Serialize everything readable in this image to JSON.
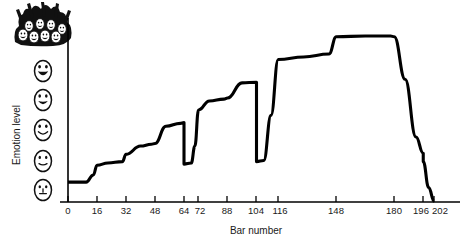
{
  "chart_data": {
    "type": "line",
    "title": "",
    "xlabel": "Bar number",
    "ylabel": "Emotion level",
    "xlim": [
      0,
      206
    ],
    "ylim": [
      0,
      5.6
    ],
    "grid": false,
    "legend": null,
    "x_ticks": [
      0,
      16,
      32,
      48,
      64,
      72,
      88,
      104,
      116,
      148,
      180,
      196,
      202
    ],
    "x_tick_labels": [
      "0",
      "16",
      "32",
      "48",
      "64",
      "72",
      "88",
      "104",
      "116",
      "148",
      "180",
      "196",
      "202"
    ],
    "y_ticks": [],
    "y_tick_labels": [],
    "y_axis_icons": [
      "neutral-face-icon",
      "slight-smile-face-icon",
      "smile-face-icon",
      "happy-face-icon",
      "very-happy-face-icon",
      "cheering-crowd-icon"
    ],
    "series": [
      {
        "name": "Emotion level",
        "comment": "Stepwise emotional intensity across bar numbers of a musical piece",
        "x": [
          0,
          10,
          14,
          16,
          22,
          30,
          32,
          40,
          46,
          48,
          54,
          62,
          64,
          64,
          68,
          70,
          72,
          78,
          86,
          88,
          96,
          104,
          104,
          108,
          112,
          116,
          130,
          144,
          148,
          164,
          178,
          180,
          186,
          192,
          196,
          196,
          199,
          202
        ],
        "y": [
          0.55,
          0.55,
          0.75,
          1.02,
          1.08,
          1.12,
          1.32,
          1.55,
          1.6,
          1.62,
          2.1,
          2.18,
          2.2,
          1.05,
          1.08,
          1.55,
          2.55,
          2.8,
          2.85,
          2.88,
          3.3,
          3.32,
          1.12,
          1.15,
          2.4,
          3.95,
          4.02,
          4.1,
          4.58,
          4.6,
          4.6,
          4.58,
          3.4,
          1.8,
          1.35,
          1.12,
          0.4,
          0.02
        ]
      }
    ],
    "annotations": []
  },
  "axis": {
    "x_title": "Bar number",
    "y_title": "Emotion level",
    "tick_labels": [
      "0",
      "16",
      "32",
      "48",
      "64",
      "72",
      "88",
      "104",
      "116",
      "148",
      "180",
      "196",
      "202"
    ]
  },
  "y_axis_icons": [
    {
      "name": "neutral-face-icon",
      "level": 0,
      "expression": "neutral"
    },
    {
      "name": "slight-smile-face-icon",
      "level": 1,
      "expression": "slight smile"
    },
    {
      "name": "smile-face-icon",
      "level": 2,
      "expression": "smile"
    },
    {
      "name": "happy-face-icon",
      "level": 3,
      "expression": "happy"
    },
    {
      "name": "very-happy-face-icon",
      "level": 4,
      "expression": "very happy"
    },
    {
      "name": "cheering-crowd-icon",
      "level": 5,
      "expression": "cheering crowd"
    }
  ],
  "colors": {
    "curve": "#000000",
    "axis": "#000000",
    "text": "#1a1a1a",
    "background": "#ffffff"
  }
}
